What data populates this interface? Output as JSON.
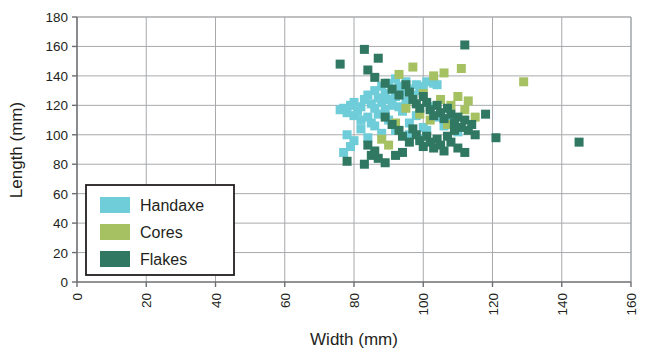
{
  "chart_data": {
    "type": "scatter",
    "title": "",
    "xlabel": "Width (mm)",
    "ylabel": "Length (mm)",
    "xlim": [
      0,
      160
    ],
    "ylim": [
      0,
      180
    ],
    "xticks": [
      0,
      20,
      40,
      60,
      80,
      100,
      120,
      140,
      160
    ],
    "yticks": [
      0,
      20,
      40,
      60,
      80,
      100,
      120,
      140,
      160,
      180
    ],
    "xtick_labels": [
      "0",
      "20",
      "40",
      "60",
      "80",
      "100",
      "120",
      "140",
      "160"
    ],
    "ytick_labels": [
      "0",
      "20",
      "40",
      "60",
      "80",
      "100",
      "120",
      "140",
      "160",
      "180"
    ],
    "grid": true,
    "grid_color": "#a7a9ac",
    "xtick_label_rotation": -90,
    "legend": {
      "position": "lower-left-inside",
      "entries": [
        {
          "name": "Handaxe",
          "color": "#6fcdd9"
        },
        {
          "name": "Cores",
          "color": "#a5c162"
        },
        {
          "name": "Flakes",
          "color": "#317863"
        }
      ]
    },
    "marker": {
      "shape": "square",
      "size_px": 9
    },
    "series": [
      {
        "name": "Handaxe",
        "color": "#6fcdd9",
        "points": [
          [
            76,
            117
          ],
          [
            77,
            118
          ],
          [
            78,
            115
          ],
          [
            79,
            120
          ],
          [
            80,
            113
          ],
          [
            80,
            122
          ],
          [
            81,
            116
          ],
          [
            82,
            119
          ],
          [
            82,
            110
          ],
          [
            83,
            124
          ],
          [
            84,
            112
          ],
          [
            84,
            127
          ],
          [
            85,
            121
          ],
          [
            85,
            108
          ],
          [
            86,
            130
          ],
          [
            86,
            118
          ],
          [
            87,
            125
          ],
          [
            87,
            114
          ],
          [
            88,
            133
          ],
          [
            88,
            122
          ],
          [
            89,
            128
          ],
          [
            89,
            117
          ],
          [
            90,
            135
          ],
          [
            90,
            124
          ],
          [
            91,
            131
          ],
          [
            91,
            120
          ],
          [
            92,
            138
          ],
          [
            92,
            126
          ],
          [
            93,
            133
          ],
          [
            93,
            119
          ],
          [
            94,
            129
          ],
          [
            95,
            136
          ],
          [
            95,
            123
          ],
          [
            96,
            131
          ],
          [
            97,
            127
          ],
          [
            98,
            134
          ],
          [
            99,
            130
          ],
          [
            100,
            133
          ],
          [
            101,
            136
          ],
          [
            103,
            135
          ],
          [
            104,
            134
          ],
          [
            78,
            100
          ],
          [
            80,
            96
          ],
          [
            82,
            104
          ],
          [
            84,
            98
          ],
          [
            86,
            106
          ],
          [
            88,
            101
          ],
          [
            90,
            110
          ],
          [
            92,
            103
          ],
          [
            94,
            116
          ],
          [
            96,
            108
          ],
          [
            98,
            113
          ],
          [
            100,
            105
          ],
          [
            102,
            119
          ],
          [
            104,
            112
          ],
          [
            77,
            88
          ],
          [
            79,
            92
          ],
          [
            96,
            100
          ],
          [
            99,
            97
          ],
          [
            101,
            103
          ],
          [
            106,
            106
          ],
          [
            108,
            109
          ],
          [
            110,
            102
          ]
        ]
      },
      {
        "name": "Cores",
        "color": "#a5c162",
        "points": [
          [
            93,
            141
          ],
          [
            97,
            146
          ],
          [
            103,
            140
          ],
          [
            111,
            145
          ],
          [
            129,
            136
          ],
          [
            106,
            142
          ],
          [
            100,
            128
          ],
          [
            105,
            124
          ],
          [
            108,
            120
          ],
          [
            112,
            117
          ],
          [
            115,
            112
          ],
          [
            90,
            93
          ],
          [
            95,
            118
          ],
          [
            99,
            114
          ],
          [
            102,
            110
          ],
          [
            107,
            107
          ],
          [
            110,
            126
          ],
          [
            113,
            123
          ],
          [
            88,
            97
          ],
          [
            92,
            108
          ]
        ]
      },
      {
        "name": "Flakes",
        "color": "#317863",
        "points": [
          [
            76,
            148
          ],
          [
            83,
            158
          ],
          [
            87,
            152
          ],
          [
            112,
            161
          ],
          [
            84,
            144
          ],
          [
            86,
            139
          ],
          [
            89,
            135
          ],
          [
            91,
            131
          ],
          [
            93,
            127
          ],
          [
            95,
            134
          ],
          [
            96,
            129
          ],
          [
            97,
            124
          ],
          [
            98,
            121
          ],
          [
            99,
            118
          ],
          [
            100,
            126
          ],
          [
            101,
            122
          ],
          [
            102,
            117
          ],
          [
            103,
            113
          ],
          [
            104,
            120
          ],
          [
            105,
            115
          ],
          [
            106,
            111
          ],
          [
            107,
            118
          ],
          [
            108,
            114
          ],
          [
            109,
            108
          ],
          [
            110,
            112
          ],
          [
            111,
            105
          ],
          [
            112,
            110
          ],
          [
            113,
            103
          ],
          [
            114,
            107
          ],
          [
            115,
            100
          ],
          [
            118,
            114
          ],
          [
            121,
            98
          ],
          [
            89,
            112
          ],
          [
            91,
            107
          ],
          [
            93,
            103
          ],
          [
            94,
            99
          ],
          [
            96,
            95
          ],
          [
            97,
            104
          ],
          [
            98,
            100
          ],
          [
            99,
            96
          ],
          [
            100,
            92
          ],
          [
            101,
            99
          ],
          [
            102,
            95
          ],
          [
            103,
            91
          ],
          [
            104,
            97
          ],
          [
            105,
            93
          ],
          [
            106,
            89
          ],
          [
            108,
            95
          ],
          [
            110,
            91
          ],
          [
            112,
            88
          ],
          [
            84,
            93
          ],
          [
            86,
            89
          ],
          [
            78,
            82
          ],
          [
            83,
            80
          ],
          [
            89,
            81
          ],
          [
            85,
            86
          ],
          [
            87,
            84
          ],
          [
            145,
            95
          ],
          [
            94,
            88
          ],
          [
            92,
            86
          ],
          [
            107,
            99
          ],
          [
            109,
            103
          ]
        ]
      }
    ]
  }
}
